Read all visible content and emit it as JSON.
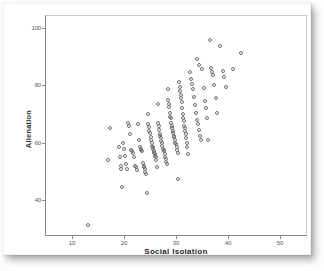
{
  "chart_data": {
    "type": "scatter",
    "title": "",
    "xlabel": "Social Isolation",
    "ylabel": "Alienation",
    "xlim": [
      5,
      55
    ],
    "ylim": [
      28,
      104
    ],
    "xticks": [
      10,
      20,
      30,
      40,
      50
    ],
    "yticks": [
      40,
      60,
      80,
      100
    ],
    "xtick_labels": [
      "10",
      "20",
      "30",
      "40",
      "50"
    ],
    "ytick_labels": [
      "40",
      "60",
      "80",
      "100"
    ],
    "grid": false,
    "legend": null,
    "marker": "open-circle",
    "marker_color": "#6e6e6e",
    "points": [
      [
        13.0,
        31.5
      ],
      [
        17.0,
        54.0
      ],
      [
        17.3,
        65.0
      ],
      [
        19.0,
        58.5
      ],
      [
        19.2,
        55.0
      ],
      [
        19.4,
        52.0
      ],
      [
        19.5,
        51.0
      ],
      [
        19.6,
        44.5
      ],
      [
        19.8,
        60.0
      ],
      [
        20.0,
        58.0
      ],
      [
        20.2,
        55.5
      ],
      [
        20.4,
        52.5
      ],
      [
        20.6,
        51.0
      ],
      [
        20.8,
        67.0
      ],
      [
        21.0,
        66.0
      ],
      [
        21.2,
        63.0
      ],
      [
        21.4,
        57.5
      ],
      [
        21.6,
        57.0
      ],
      [
        21.8,
        56.5
      ],
      [
        22.0,
        55.0
      ],
      [
        22.2,
        52.0
      ],
      [
        22.4,
        51.5
      ],
      [
        22.5,
        50.5
      ],
      [
        22.7,
        66.5
      ],
      [
        22.9,
        61.0
      ],
      [
        23.0,
        58.5
      ],
      [
        23.2,
        58.0
      ],
      [
        23.3,
        57.5
      ],
      [
        23.5,
        57.0
      ],
      [
        23.6,
        53.0
      ],
      [
        23.8,
        52.0
      ],
      [
        23.9,
        51.5
      ],
      [
        24.0,
        51.0
      ],
      [
        24.1,
        50.0
      ],
      [
        24.2,
        49.0
      ],
      [
        24.4,
        42.5
      ],
      [
        24.6,
        70.0
      ],
      [
        24.7,
        66.5
      ],
      [
        24.8,
        65.5
      ],
      [
        24.9,
        64.0
      ],
      [
        25.0,
        63.5
      ],
      [
        25.1,
        62.0
      ],
      [
        25.2,
        61.0
      ],
      [
        25.3,
        60.0
      ],
      [
        25.4,
        59.0
      ],
      [
        25.5,
        58.5
      ],
      [
        25.6,
        58.0
      ],
      [
        25.7,
        57.0
      ],
      [
        25.8,
        56.5
      ],
      [
        25.9,
        56.0
      ],
      [
        26.0,
        55.5
      ],
      [
        26.1,
        55.0
      ],
      [
        26.2,
        54.0
      ],
      [
        26.3,
        51.5
      ],
      [
        26.5,
        73.5
      ],
      [
        26.6,
        67.0
      ],
      [
        26.7,
        66.0
      ],
      [
        26.8,
        64.5
      ],
      [
        26.9,
        63.0
      ],
      [
        27.0,
        62.5
      ],
      [
        27.1,
        61.5
      ],
      [
        27.2,
        60.5
      ],
      [
        27.3,
        60.0
      ],
      [
        27.4,
        59.0
      ],
      [
        27.5,
        58.0
      ],
      [
        27.6,
        57.5
      ],
      [
        27.7,
        57.0
      ],
      [
        27.8,
        56.0
      ],
      [
        27.9,
        55.0
      ],
      [
        28.0,
        54.5
      ],
      [
        28.1,
        53.5
      ],
      [
        28.2,
        52.5
      ],
      [
        28.4,
        78.5
      ],
      [
        28.5,
        75.0
      ],
      [
        28.6,
        73.5
      ],
      [
        28.7,
        72.5
      ],
      [
        28.8,
        70.5
      ],
      [
        28.9,
        69.0
      ],
      [
        29.0,
        68.5
      ],
      [
        29.1,
        67.0
      ],
      [
        29.2,
        66.0
      ],
      [
        29.3,
        65.0
      ],
      [
        29.4,
        64.0
      ],
      [
        29.5,
        63.5
      ],
      [
        29.6,
        62.5
      ],
      [
        29.7,
        62.0
      ],
      [
        29.8,
        61.0
      ],
      [
        29.9,
        60.0
      ],
      [
        30.0,
        59.5
      ],
      [
        30.1,
        58.5
      ],
      [
        30.2,
        57.5
      ],
      [
        30.3,
        56.5
      ],
      [
        30.4,
        47.5
      ],
      [
        30.6,
        81.0
      ],
      [
        30.7,
        79.5
      ],
      [
        30.8,
        78.0
      ],
      [
        30.9,
        76.5
      ],
      [
        31.0,
        75.5
      ],
      [
        31.1,
        74.0
      ],
      [
        31.2,
        72.0
      ],
      [
        31.3,
        70.0
      ],
      [
        31.4,
        68.5
      ],
      [
        31.5,
        67.5
      ],
      [
        31.6,
        66.0
      ],
      [
        31.7,
        65.0
      ],
      [
        31.8,
        64.0
      ],
      [
        31.9,
        63.0
      ],
      [
        32.0,
        61.5
      ],
      [
        32.1,
        60.0
      ],
      [
        32.2,
        58.5
      ],
      [
        32.3,
        56.0
      ],
      [
        32.6,
        84.5
      ],
      [
        32.8,
        82.0
      ],
      [
        33.0,
        80.5
      ],
      [
        33.2,
        78.5
      ],
      [
        33.4,
        76.0
      ],
      [
        33.6,
        73.0
      ],
      [
        33.8,
        70.5
      ],
      [
        34.0,
        68.0
      ],
      [
        34.2,
        66.5
      ],
      [
        34.4,
        64.5
      ],
      [
        34.6,
        62.5
      ],
      [
        34.8,
        61.0
      ],
      [
        34.0,
        89.0
      ],
      [
        34.5,
        87.0
      ],
      [
        35.0,
        85.5
      ],
      [
        35.3,
        79.0
      ],
      [
        35.6,
        74.5
      ],
      [
        35.8,
        72.0
      ],
      [
        36.0,
        68.5
      ],
      [
        36.2,
        61.0
      ],
      [
        36.5,
        95.5
      ],
      [
        36.8,
        86.0
      ],
      [
        37.0,
        84.5
      ],
      [
        37.2,
        83.5
      ],
      [
        37.4,
        80.0
      ],
      [
        37.6,
        75.5
      ],
      [
        37.8,
        70.5
      ],
      [
        38.5,
        93.5
      ],
      [
        39.0,
        85.0
      ],
      [
        39.3,
        83.0
      ],
      [
        39.6,
        79.5
      ],
      [
        41.0,
        85.5
      ],
      [
        42.5,
        91.0
      ]
    ]
  },
  "figure": {
    "axis_color": "#8a8a8a",
    "marker_stroke": "#6e6e6e",
    "card_background": "#ffffff"
  }
}
